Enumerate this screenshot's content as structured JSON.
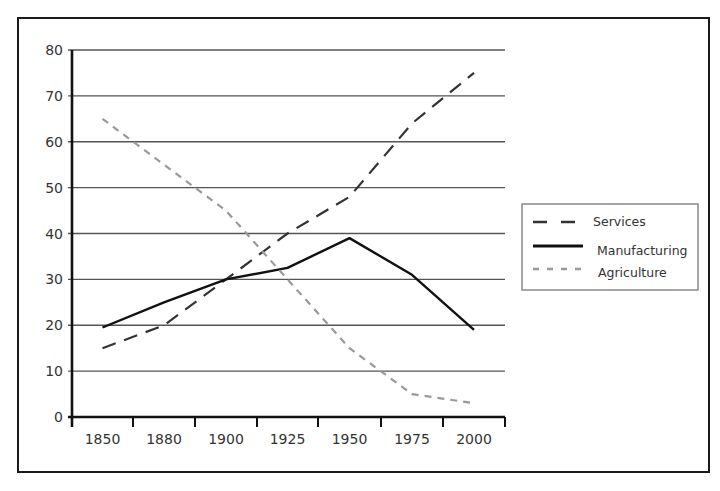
{
  "chart_data": {
    "type": "line",
    "title": "",
    "xlabel": "",
    "ylabel": "",
    "categories": [
      "1850",
      "1880",
      "1900",
      "1925",
      "1950",
      "1975",
      "2000"
    ],
    "ylim": [
      0,
      80
    ],
    "yticks": [
      0,
      10,
      20,
      30,
      40,
      50,
      60,
      70,
      80
    ],
    "grid": true,
    "legend_position": "right",
    "series": [
      {
        "name": "Services",
        "style": "long-dash",
        "color": "#333333",
        "values": [
          15,
          20,
          30,
          40,
          48,
          64,
          75
        ]
      },
      {
        "name": "Manufacturing",
        "style": "solid",
        "color": "#111111",
        "values": [
          19.5,
          25,
          30,
          32.5,
          39,
          31,
          19
        ]
      },
      {
        "name": "Agriculture",
        "style": "short-dash",
        "color": "#999999",
        "values": [
          65,
          55,
          45,
          30,
          15,
          5,
          3
        ]
      }
    ]
  },
  "layout": {
    "frame": {
      "x": 18,
      "y": 18,
      "w": 691,
      "h": 454
    },
    "plot": {
      "x0": 72,
      "x1": 505,
      "y0": 417,
      "y1": 50
    },
    "xticks_px": [
      72,
      133,
      195,
      257,
      318,
      381,
      443,
      505
    ],
    "legend": {
      "x": 522,
      "y": 204,
      "w": 176,
      "h": 86
    }
  }
}
